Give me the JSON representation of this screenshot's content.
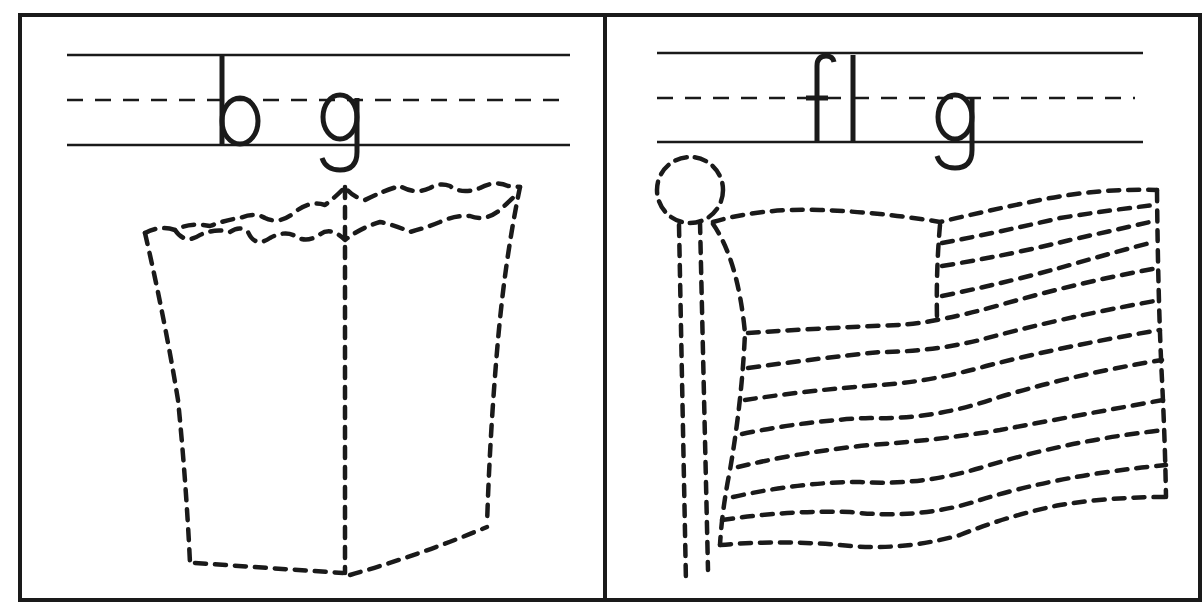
{
  "worksheet": {
    "panels": [
      {
        "id": "bag",
        "word_parts": [
          "b",
          "g"
        ],
        "missing_letter_slot": "_",
        "picture": "paper bag (dashed trace outline)"
      },
      {
        "id": "flag",
        "word_parts": [
          "fl",
          "g"
        ],
        "missing_letter_slot": "_",
        "picture": "flag on pole (dashed trace outline)"
      }
    ],
    "colors": {
      "ink": "#1a1a1a",
      "paper": "#ffffff"
    }
  }
}
